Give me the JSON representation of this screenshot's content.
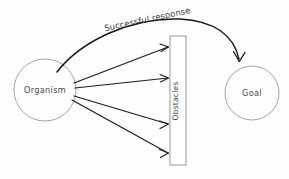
{
  "diagram": {
    "background_color": "#fefefe",
    "line_color": "#1d1d1d",
    "shape_stroke_color": "#9a9a9a",
    "text_color": "#4a4a4a",
    "nodes": {
      "organism": {
        "label": "Organism",
        "shape": "circle",
        "cx": 45,
        "cy": 90,
        "r": 31
      },
      "goal": {
        "label": "Goal",
        "shape": "circle",
        "cx": 252,
        "cy": 93,
        "r": 27
      },
      "obstacles": {
        "label": "Obstacles",
        "shape": "rectangle",
        "x": 170,
        "y": 36,
        "width": 16,
        "height": 129,
        "text_orientation": "vertical"
      }
    },
    "edges": {
      "blocked_attempts": {
        "count": 4,
        "label": "",
        "targets": [
          46,
          78,
          124,
          152
        ]
      },
      "successful_response": {
        "label": "Successful  response",
        "style": "curved-arrow",
        "from": "organism",
        "to": "goal"
      }
    }
  }
}
